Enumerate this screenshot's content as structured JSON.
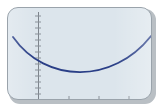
{
  "window": {
    "kind": "graph-viewer-panel",
    "title": "",
    "frame_border_color": "#9aa3ab",
    "frame_background_color": "#dce5ec",
    "frame_corner_radius": "11px",
    "shadow_color": "#b9bfc4"
  },
  "chart_data": {
    "type": "line",
    "title": "",
    "subtitle": "",
    "xlabel": "",
    "ylabel": "",
    "legend": [],
    "legend_position": "none",
    "grid": false,
    "annotations": [],
    "axes": {
      "x_axis_visible": true,
      "y_axis_visible": true,
      "x_axis_color": "#8a9199",
      "y_axis_color": "#7d848c",
      "x_axis_pixel_y": 92,
      "y_axis_pixel_x": 30,
      "x_tick_count": 3,
      "y_tick_count": 15,
      "x_tick_pixel_positions": [
        61,
        91,
        121
      ],
      "tick_color": "#8a9199"
    },
    "xlim": [
      -4,
      10
    ],
    "ylim": [
      -2,
      8
    ],
    "series": [
      {
        "name": "parabola",
        "color": "#2a3f87",
        "line_width": 1.8,
        "x": [
          -4.0,
          -3.5,
          -3.0,
          -2.5,
          -2.0,
          -1.5,
          -1.0,
          -0.5,
          0.0,
          0.5,
          1.0,
          1.5,
          2.0,
          2.5,
          3.0,
          3.5,
          4.0,
          4.5,
          5.0,
          5.5,
          6.0,
          6.5,
          7.0,
          7.5,
          8.0,
          8.5,
          9.0,
          9.5
        ],
        "y": [
          5.65,
          5.15,
          4.68,
          4.23,
          3.81,
          3.41,
          3.04,
          2.7,
          2.38,
          2.09,
          1.83,
          1.59,
          1.38,
          1.2,
          1.04,
          0.91,
          0.81,
          0.73,
          0.68,
          0.66,
          0.67,
          0.7,
          0.76,
          0.85,
          0.96,
          1.1,
          1.27,
          1.46
        ]
      }
    ],
    "vertex": {
      "x": 5.5,
      "y": 0.66
    },
    "curve_pixels": {
      "start": [
        5,
        29
      ],
      "vertex": [
        71,
        66
      ],
      "end": [
        143,
        28
      ],
      "control_left": [
        38,
        76
      ],
      "control_right": [
        105,
        76
      ]
    }
  }
}
